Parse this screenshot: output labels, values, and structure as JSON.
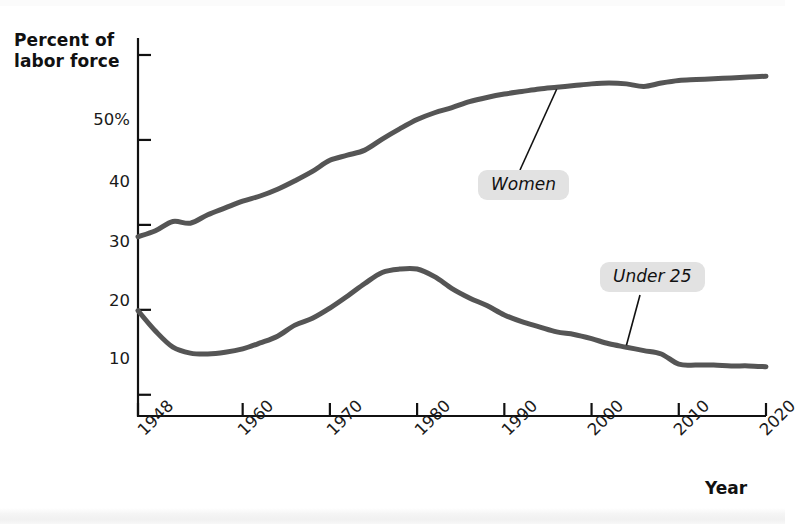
{
  "chart_data": {
    "type": "line",
    "title": "",
    "xlabel": "Year",
    "ylabel": "Percent of labor force",
    "ylabel_line1": "Percent of",
    "ylabel_line2": "labor force",
    "xlim": [
      1948,
      2020
    ],
    "ylim": [
      7.5,
      52
    ],
    "grid": false,
    "legend": "inline-callouts",
    "ytick_labels": [
      "50%",
      "40",
      "30",
      "20",
      "10"
    ],
    "ytick_values": [
      50,
      40,
      30,
      20,
      10
    ],
    "xtick_labels": [
      "1948",
      "1960",
      "1970",
      "1980",
      "1990",
      "2000",
      "2010",
      "2020"
    ],
    "xtick_values": [
      1948,
      1960,
      1970,
      1980,
      1990,
      2000,
      2010,
      2020
    ],
    "line_color": "#555555",
    "axis_color": "#111111",
    "label_box_color": "#e2e2e2",
    "series": [
      {
        "name": "Women",
        "x": [
          1948,
          1950,
          1952,
          1954,
          1956,
          1958,
          1960,
          1962,
          1964,
          1966,
          1968,
          1970,
          1972,
          1974,
          1976,
          1978,
          1980,
          1982,
          1984,
          1986,
          1988,
          1990,
          1992,
          1994,
          1996,
          1998,
          2000,
          2002,
          2004,
          2006,
          2008,
          2010,
          2012,
          2014,
          2016,
          2018,
          2020
        ],
        "values": [
          28.6,
          29.3,
          30.4,
          30.2,
          31.2,
          32.0,
          32.8,
          33.4,
          34.2,
          35.2,
          36.3,
          37.6,
          38.2,
          38.8,
          40.1,
          41.3,
          42.4,
          43.2,
          43.8,
          44.5,
          45.0,
          45.4,
          45.7,
          46.0,
          46.2,
          46.4,
          46.6,
          46.7,
          46.6,
          46.3,
          46.7,
          47.0,
          47.1,
          47.2,
          47.3,
          47.4,
          47.5
        ]
      },
      {
        "name": "Under 25",
        "x": [
          1948,
          1950,
          1952,
          1954,
          1956,
          1958,
          1960,
          1962,
          1964,
          1966,
          1968,
          1970,
          1972,
          1974,
          1976,
          1978,
          1980,
          1982,
          1984,
          1986,
          1988,
          1990,
          1992,
          1994,
          1996,
          1998,
          2000,
          2002,
          2004,
          2006,
          2008,
          2010,
          2012,
          2014,
          2016,
          2018,
          2020
        ],
        "values": [
          19.9,
          17.5,
          15.6,
          14.9,
          14.8,
          15.0,
          15.4,
          16.1,
          16.9,
          18.2,
          19.0,
          20.2,
          21.6,
          23.1,
          24.4,
          24.8,
          24.8,
          23.9,
          22.5,
          21.4,
          20.5,
          19.4,
          18.6,
          18.0,
          17.4,
          17.1,
          16.6,
          16.0,
          15.6,
          15.2,
          14.8,
          13.6,
          13.5,
          13.5,
          13.4,
          13.4,
          13.3
        ]
      }
    ],
    "annotations": [
      {
        "text": "Women",
        "series": "Women",
        "anchor_year": 1996,
        "anchor_value": 46.2
      },
      {
        "text": "Under 25",
        "series": "Under 25",
        "anchor_year": 2004,
        "anchor_value": 15.6
      }
    ]
  },
  "axes": {
    "y_title_line1": "Percent of",
    "y_title_line2": "labor force",
    "x_title": "Year"
  },
  "ticks": {
    "y": [
      {
        "label": "50%",
        "top": 110
      },
      {
        "label": "40",
        "top": 172
      },
      {
        "label": "30",
        "top": 232
      },
      {
        "label": "20",
        "top": 291
      },
      {
        "label": "10",
        "top": 349
      }
    ],
    "x": [
      {
        "label": "1948",
        "left": 134,
        "top": 426
      },
      {
        "label": "1960",
        "left": 234,
        "top": 426
      },
      {
        "label": "1970",
        "left": 323,
        "top": 426
      },
      {
        "label": "1980",
        "left": 411,
        "top": 426
      },
      {
        "label": "1990",
        "left": 498,
        "top": 426
      },
      {
        "label": "2000",
        "left": 584,
        "top": 426
      },
      {
        "label": "2010",
        "left": 670,
        "top": 426
      },
      {
        "label": "2020",
        "left": 756,
        "top": 426
      }
    ]
  },
  "labels": {
    "women": "Women",
    "under25": "Under 25"
  }
}
